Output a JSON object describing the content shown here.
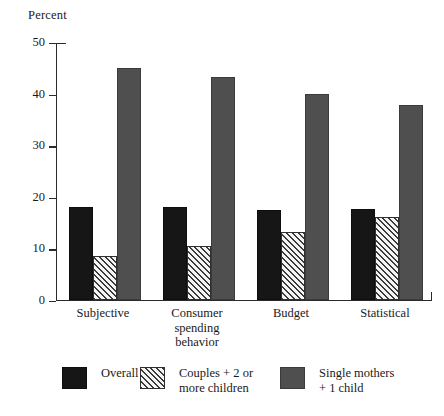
{
  "chart_data": {
    "type": "bar",
    "title": "",
    "ylabel": "Percent",
    "xlabel": "",
    "ylim": [
      0,
      50
    ],
    "yticks": [
      "0",
      "10",
      "20",
      "30",
      "40",
      "50"
    ],
    "grid": false,
    "legend_position": "bottom",
    "categories": [
      "Subjective",
      "Consumer\nspending\nbehavior",
      "Budget",
      "Statistical"
    ],
    "series": [
      {
        "name": "Overall",
        "pattern": "solid-black",
        "color": "#161616",
        "values": [
          18.0,
          18.0,
          17.4,
          17.5
        ]
      },
      {
        "name": "Couples + 2 or\nmore children",
        "pattern": "diagonal-hatch",
        "color": "#f4f4f4",
        "values": [
          8.5,
          10.3,
          13.2,
          16.0
        ]
      },
      {
        "name": "Single mothers\n+ 1  child",
        "pattern": "solid-gray",
        "color": "#4f4f4f",
        "values": [
          44.8,
          43.2,
          39.9,
          37.7
        ]
      }
    ]
  },
  "axis": {
    "y_title": "Percent"
  }
}
